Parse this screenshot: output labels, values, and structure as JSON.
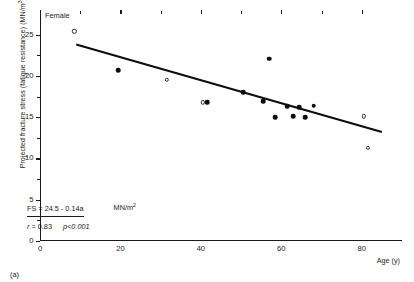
{
  "caption": "(a)",
  "group_label": "Female",
  "annotation": {
    "equation": "FS = 24.5 - 0.14a",
    "equation_unit": "MN/m",
    "equation_unit_exp": "2",
    "r_label": "r",
    "r_value": "= 0.83",
    "p_value": "p<0.001"
  },
  "axes": {
    "ylabel_text": "Projected fracture stress (fatigue resistance) (MN/m",
    "ylabel_exp": "3",
    "ylabel_tail": ")",
    "xlabel": "Age (y)"
  },
  "chart_data": {
    "type": "scatter",
    "title": "",
    "subtitle": "",
    "xlabel": "Age (y)",
    "ylabel": "Projected fracture stress (fatigue resistance) (MN/m3)",
    "xlim": [
      0,
      90
    ],
    "ylim": [
      0,
      27.5
    ],
    "xticks": [
      0,
      20,
      40,
      60,
      80
    ],
    "xticks_minor": [
      10,
      30,
      50,
      70
    ],
    "yticks": [
      0,
      5,
      10,
      15,
      20,
      25
    ],
    "yticks_minor": [
      2.5,
      7.5,
      12.5,
      17.5,
      22.5
    ],
    "grid": false,
    "legend": null,
    "annotations": [
      {
        "text": "Female",
        "x": 4,
        "y": 26.8
      },
      {
        "text": "FS = 24.5 - 0.14a   MN/m2",
        "x": 6,
        "y": 7.4
      },
      {
        "text": "r = 0.83  p<0.001",
        "x": 6,
        "y": 6.0
      }
    ],
    "series": [
      {
        "name": "open circles",
        "marker": "open-circle",
        "points": [
          {
            "x": 8.5,
            "y": 25.4
          },
          {
            "x": 31.5,
            "y": 19.5
          },
          {
            "x": 40.5,
            "y": 16.8
          },
          {
            "x": 80.5,
            "y": 15.1
          },
          {
            "x": 81.5,
            "y": 11.3
          }
        ]
      },
      {
        "name": "filled circles",
        "marker": "filled-circle",
        "points": [
          {
            "x": 19.5,
            "y": 20.7
          },
          {
            "x": 41.5,
            "y": 16.8
          },
          {
            "x": 50.5,
            "y": 18.0
          },
          {
            "x": 55.5,
            "y": 16.9
          },
          {
            "x": 57.0,
            "y": 22.1
          },
          {
            "x": 58.5,
            "y": 15.0
          },
          {
            "x": 61.5,
            "y": 16.3
          },
          {
            "x": 63.0,
            "y": 15.1
          },
          {
            "x": 64.5,
            "y": 16.2
          },
          {
            "x": 66.0,
            "y": 15.0
          },
          {
            "x": 68.0,
            "y": 16.4
          }
        ]
      }
    ],
    "fit_line": {
      "equation": "FS = 24.5 - 0.14a",
      "r": 0.83,
      "p": "<0.001",
      "intercept": 24.5,
      "slope": -0.14,
      "x_start": 9,
      "x_end": 85,
      "y_start": 23.8,
      "y_end": 13.2
    }
  }
}
